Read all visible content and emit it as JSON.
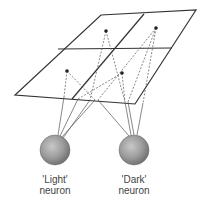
{
  "diagram": {
    "plane": {
      "corners": [
        [
          101,
          15
        ],
        [
          196,
          10
        ],
        [
          135,
          104
        ],
        [
          15,
          95
        ]
      ],
      "color": "#333333"
    },
    "dots": [
      {
        "id": "top-left",
        "x": 106,
        "y": 31
      },
      {
        "id": "top-right",
        "x": 156,
        "y": 28
      },
      {
        "id": "bottom-left",
        "x": 67,
        "y": 71
      },
      {
        "id": "bottom-right",
        "x": 122,
        "y": 73
      }
    ],
    "neurons": [
      {
        "id": "light",
        "label_line1": "'Light'",
        "label_line2": "neuron",
        "cx": 55,
        "cy": 150,
        "r": 15
      },
      {
        "id": "dark",
        "label_line1": "'Dark'",
        "label_line2": "neuron",
        "cx": 134,
        "cy": 150,
        "r": 15
      }
    ]
  }
}
